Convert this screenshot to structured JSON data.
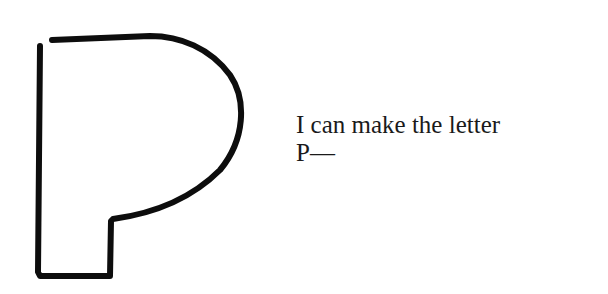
{
  "caption": {
    "line1": "I can make the letter",
    "line2": "P—"
  },
  "drawing": {
    "subject": "hand-drawn-letter-p-outline",
    "stroke_color": "#0d0d0d"
  }
}
